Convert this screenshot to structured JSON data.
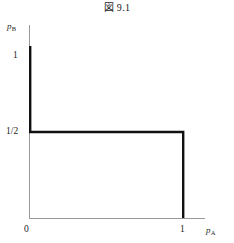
{
  "figure": {
    "title": "図 9.1"
  },
  "axes": {
    "y_label_base": "p",
    "y_label_sub": "B",
    "x_label_base": "p",
    "x_label_sub": "A",
    "y_ticks": [
      {
        "label": "1",
        "value": 1
      },
      {
        "label": "1/2",
        "value": 0.5
      }
    ],
    "x_ticks": [
      {
        "label": "0",
        "value": 0
      },
      {
        "label": "1",
        "value": 1
      }
    ],
    "axis_color": "#9a9a9a",
    "curve_color": "#111111"
  },
  "chart_data": {
    "type": "line",
    "title": "図 9.1",
    "xlabel": "p_A",
    "ylabel": "p_B",
    "xlim": [
      0,
      1.12
    ],
    "ylim": [
      0,
      1.18
    ],
    "grid": false,
    "legend": null,
    "xtick_values": [
      0,
      1
    ],
    "xtick_labels": [
      "0",
      "1"
    ],
    "ytick_values": [
      0.5,
      1
    ],
    "ytick_labels": [
      "1/2",
      "1"
    ],
    "series": [
      {
        "name": "best-response step curve",
        "x": [
          0,
          0,
          1,
          1
        ],
        "y": [
          1,
          0.5,
          0.5,
          0
        ],
        "linewidth": 2.4,
        "color": "#111111"
      }
    ],
    "annotations": []
  }
}
